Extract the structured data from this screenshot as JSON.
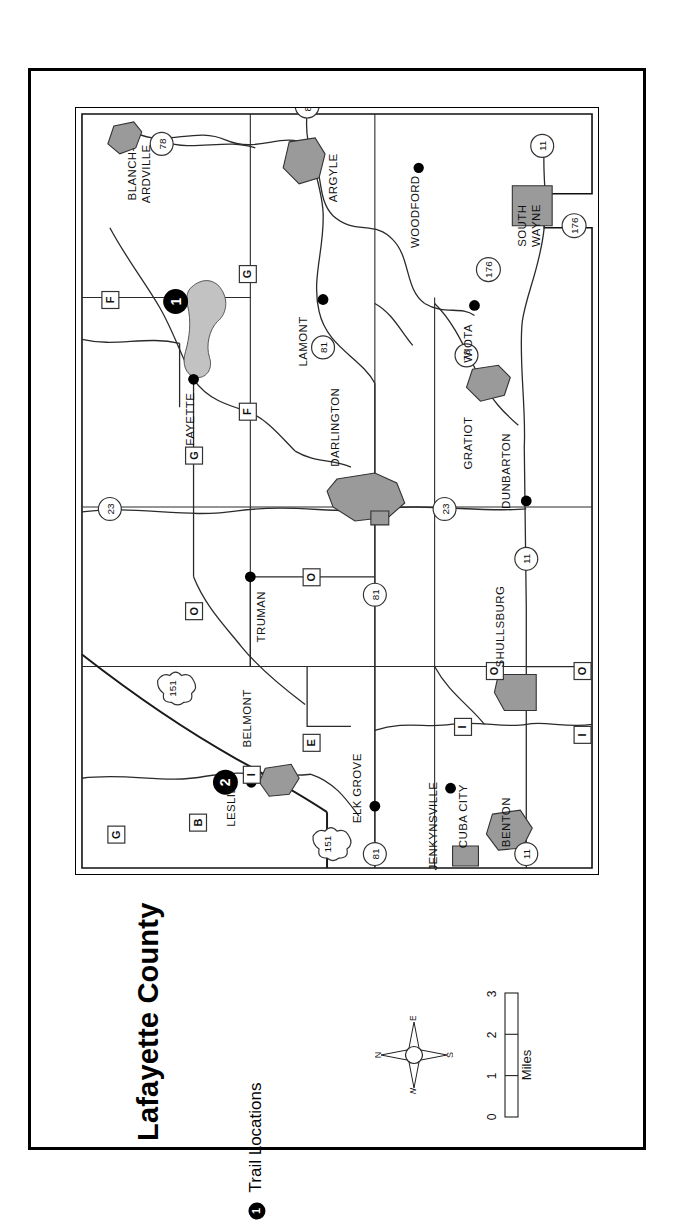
{
  "title": "Lafayette County",
  "legend": {
    "symbol": "1",
    "label": "Trail Locations"
  },
  "compass": {
    "north": "N",
    "east": "E",
    "south": "S",
    "west": "W"
  },
  "scale": {
    "ticks": [
      "0",
      "1",
      "2",
      "3"
    ],
    "units": "Miles"
  },
  "colors": {
    "city_fill": "#9a9a9a",
    "water_fill": "#c2c2c2",
    "line": "#1a1a1a",
    "frame": "#000000",
    "background": "#ffffff"
  },
  "map": {
    "trail_markers": [
      {
        "id": "1",
        "near": "Yellowstone Lake"
      },
      {
        "id": "2",
        "near": "Leslie"
      }
    ],
    "places": [
      {
        "name": "BLANCH-\nARDVILLE",
        "label_lines": [
          "BLANCH-",
          "ARDVILLE"
        ],
        "type": "village"
      },
      {
        "name": "ARGYLE",
        "type": "village"
      },
      {
        "name": "WOODFORD",
        "type": "point"
      },
      {
        "name": "SOUTH\nWAYNE",
        "label_lines": [
          "SOUTH",
          "WAYNE"
        ],
        "type": "village"
      },
      {
        "name": "WIOTA",
        "type": "point"
      },
      {
        "name": "FAYETTE",
        "type": "point"
      },
      {
        "name": "LAMONT",
        "type": "point"
      },
      {
        "name": "DARLINGTON",
        "type": "city"
      },
      {
        "name": "GRATIOT",
        "type": "village"
      },
      {
        "name": "DUNBARTON",
        "type": "point"
      },
      {
        "name": "TRUMAN",
        "type": "point"
      },
      {
        "name": "BELMONT",
        "type": "village"
      },
      {
        "name": "LESLIE",
        "type": "point"
      },
      {
        "name": "SHULLSBURG",
        "type": "city"
      },
      {
        "name": "ELK GROVE",
        "type": "point"
      },
      {
        "name": "JENKYNSVILLE",
        "type": "point"
      },
      {
        "name": "CUBA CITY",
        "type": "city"
      },
      {
        "name": "BENTON",
        "type": "village"
      }
    ],
    "state_highways": [
      "81",
      "78",
      "11",
      "176",
      "23",
      "151"
    ],
    "county_roads": [
      "F",
      "G",
      "O",
      "B",
      "E",
      "I"
    ]
  }
}
